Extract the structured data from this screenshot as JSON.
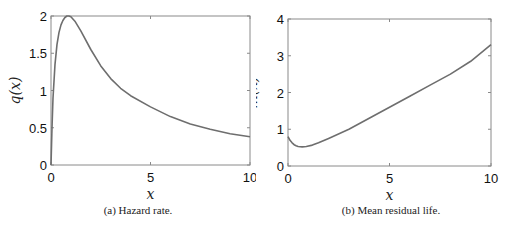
{
  "chart_data": [
    {
      "type": "line",
      "title": "",
      "caption": "(a) Hazard rate.",
      "xlabel": "x",
      "ylabel": "q(x)",
      "xlim": [
        0,
        10
      ],
      "ylim": [
        0,
        2
      ],
      "xticks": [
        0,
        5,
        10
      ],
      "xtick_labels": [
        "0",
        "5",
        "10"
      ],
      "yticks": [
        0,
        0.5,
        1,
        1.5,
        2
      ],
      "ytick_labels": [
        "0",
        "0.5",
        "1",
        "1.5",
        "2"
      ],
      "grid": false,
      "legend": null,
      "series": [
        {
          "name": "q(x)",
          "color": "#6e6e6e",
          "x": [
            0,
            0.05,
            0.1,
            0.2,
            0.3,
            0.4,
            0.5,
            0.6,
            0.7,
            0.8,
            0.9,
            1.0,
            1.2,
            1.5,
            2.0,
            2.5,
            3.0,
            3.5,
            4.0,
            5.0,
            6.0,
            7.0,
            8.0,
            9.0,
            10.0
          ],
          "values": [
            0,
            0.5,
            0.9,
            1.35,
            1.62,
            1.78,
            1.88,
            1.94,
            1.98,
            2.0,
            2.0,
            1.99,
            1.93,
            1.8,
            1.55,
            1.33,
            1.16,
            1.03,
            0.93,
            0.78,
            0.65,
            0.55,
            0.48,
            0.42,
            0.38
          ]
        }
      ]
    },
    {
      "type": "line",
      "title": "",
      "caption": "(b) Mean residual life.",
      "xlabel": "x",
      "ylabel": "m(x)",
      "xlim": [
        0,
        10
      ],
      "ylim": [
        0,
        4
      ],
      "xticks": [
        0,
        5,
        10
      ],
      "xtick_labels": [
        "0",
        "5",
        "10"
      ],
      "yticks": [
        0,
        1,
        2,
        3,
        4
      ],
      "ytick_labels": [
        "0",
        "1",
        "2",
        "3",
        "4"
      ],
      "grid": false,
      "legend": null,
      "series": [
        {
          "name": "m(x)",
          "color": "#6e6e6e",
          "x": [
            0,
            0.1,
            0.2,
            0.3,
            0.4,
            0.5,
            0.7,
            0.9,
            1.2,
            1.5,
            2.0,
            3.0,
            4.0,
            5.0,
            6.0,
            7.0,
            8.0,
            9.0,
            10.0
          ],
          "values": [
            0.8,
            0.7,
            0.63,
            0.58,
            0.55,
            0.53,
            0.52,
            0.53,
            0.57,
            0.63,
            0.75,
            1.0,
            1.3,
            1.6,
            1.9,
            2.2,
            2.5,
            2.85,
            3.3
          ]
        }
      ]
    }
  ],
  "panels": {
    "a": {
      "caption": "(a) Hazard rate.",
      "xlabel": "x",
      "ylabel": "q(x)"
    },
    "b": {
      "caption": "(b) Mean residual life.",
      "xlabel": "x",
      "ylabel": "m(x)"
    }
  }
}
